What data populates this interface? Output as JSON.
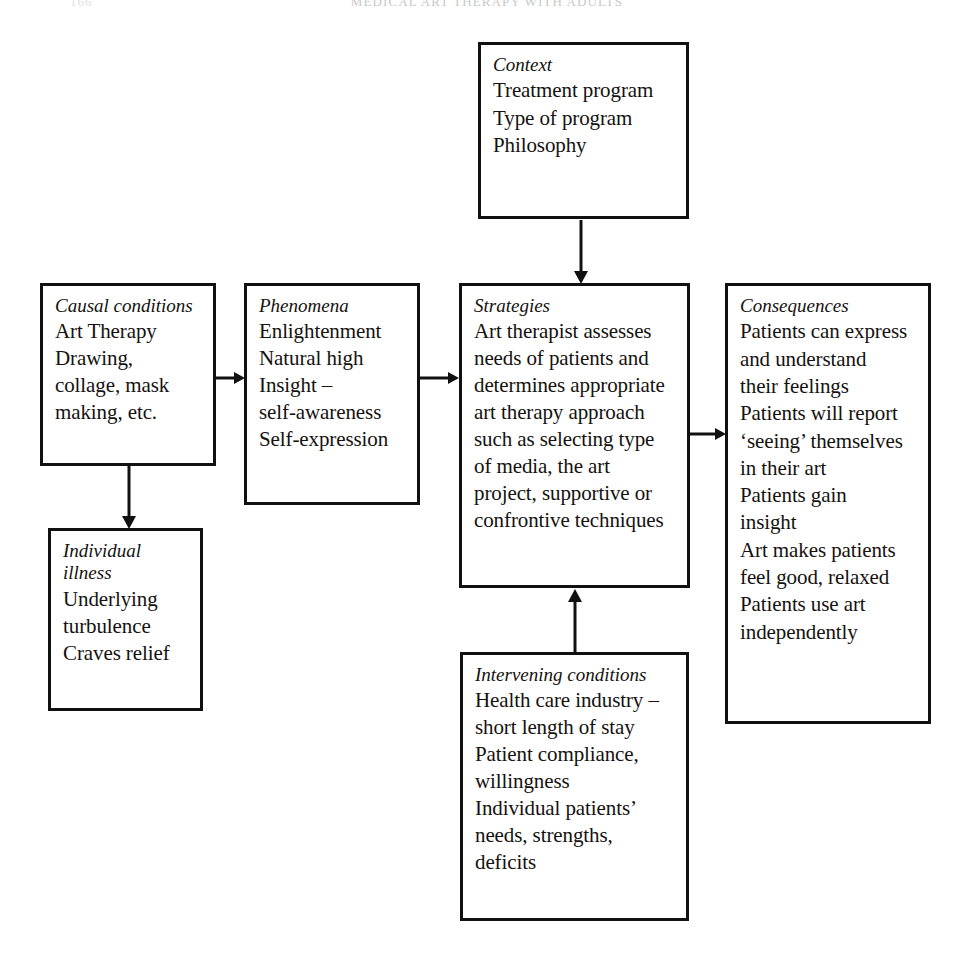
{
  "page": {
    "running_head": "MEDICAL ART THERAPY WITH ADULTS",
    "folio": "166"
  },
  "diagram": {
    "type": "grounded-theory-paradigm-model",
    "boxes": [
      {
        "id": "context",
        "heading": "Context",
        "lines": "Treatment program\nType of program\nPhilosophy"
      },
      {
        "id": "causal_conditions",
        "heading": "Causal conditions",
        "lines": "Art Therapy\nDrawing,\ncollage, mask\nmaking, etc."
      },
      {
        "id": "phenomena",
        "heading": "Phenomena",
        "lines": "Enlightenment\nNatural high\nInsight –\nself-awareness\nSelf-expression"
      },
      {
        "id": "strategies",
        "heading": "Strategies",
        "lines": "Art therapist assesses\nneeds of patients and\ndetermines appropriate\nart therapy approach\nsuch as selecting type\nof media, the art\nproject, supportive or\nconfrontive techniques"
      },
      {
        "id": "consequences",
        "heading": "Consequences",
        "lines": "Patients can express\nand understand\ntheir feelings\nPatients will report\n‘seeing’ themselves\nin their art\nPatients gain\ninsight\nArt makes patients\nfeel good, relaxed\nPatients use art\nindependently"
      },
      {
        "id": "individual_illness",
        "heading": "Individual\nillness",
        "lines": "Underlying\nturbulence\nCraves relief"
      },
      {
        "id": "intervening_conditions",
        "heading": "Intervening conditions",
        "lines": "Health care industry –\nshort length of stay\nPatient compliance,\nwillingness\nIndividual patients’\nneeds, strengths,\ndeficits"
      }
    ],
    "arrows": [
      {
        "id": "causal-to-phenomena",
        "direction": "right"
      },
      {
        "id": "phenomena-to-strategies",
        "direction": "right"
      },
      {
        "id": "strategies-to-consequences",
        "direction": "right"
      },
      {
        "id": "context-to-strategies",
        "direction": "down"
      },
      {
        "id": "causal-to-illness",
        "direction": "down"
      },
      {
        "id": "intervening-to-strategies",
        "direction": "up"
      }
    ],
    "colors": {
      "ink": "#111111",
      "paper": "#ffffff"
    }
  }
}
